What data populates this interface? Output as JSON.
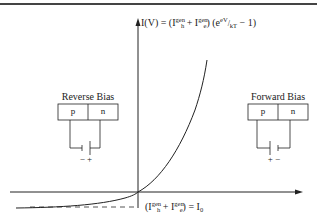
{
  "diagram": {
    "equation": {
      "lhs": "I(V) = (I",
      "h_sup": "gen",
      "h_sub": "h",
      "plus": " + I",
      "e_sup": "gen",
      "e_sub": "e",
      "close": ") (e",
      "exp": "eV",
      "exp_den": "kT",
      "tail": " − 1)"
    },
    "saturation_label": {
      "open": "(I",
      "h_sup": "gen",
      "h_sub": "h",
      "plus": " + I",
      "e_sup": "gen",
      "e_sub": "e",
      "close": ") = I",
      "zero_sub": "0"
    },
    "reverse_bias": {
      "title": "Reverse Bias",
      "left": "p",
      "right": "n",
      "polarity": "− +"
    },
    "forward_bias": {
      "title": "Forward Bias",
      "left": "p",
      "right": "n",
      "polarity": "+ −"
    },
    "colors": {
      "line": "#222222",
      "dashed": "#555555",
      "top_rule": "#444444"
    }
  }
}
